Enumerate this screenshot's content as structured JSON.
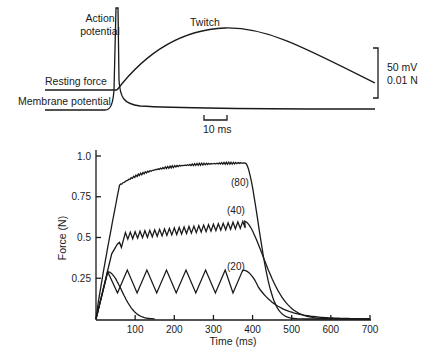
{
  "chart_data": [
    {
      "type": "line",
      "title": "",
      "labels": {
        "action_potential": [
          "Action",
          "potential"
        ],
        "twitch": "Twitch",
        "resting_force": "Resting force",
        "membrane_potential": "Membrane potential"
      },
      "scale_bars": {
        "time": "10 ms",
        "vertical": [
          "50 mV",
          "0.01 N"
        ]
      },
      "series": [
        {
          "name": "Action potential / Membrane potential",
          "description": "sharp spike then decays to resting baseline"
        },
        {
          "name": "Twitch",
          "description": "force rises from resting force, peaks, then slowly declines"
        }
      ]
    },
    {
      "type": "line",
      "title": "",
      "xlabel": "Time (ms)",
      "ylabel": "Force (N)",
      "xlim": [
        0,
        700
      ],
      "ylim": [
        0,
        1.0
      ],
      "xticks": [
        "100",
        "200",
        "300",
        "400",
        "500",
        "600",
        "700"
      ],
      "yticks": [
        "0.25",
        "0.5",
        "0.75",
        "1.0"
      ],
      "series": [
        {
          "name": "single twitch",
          "x": [
            0,
            30,
            60,
            90,
            120,
            150
          ],
          "y": [
            0,
            0.29,
            0.2,
            0.08,
            0.02,
            0.0
          ]
        },
        {
          "name": "(20)",
          "label": "(20)",
          "peaks_ms": [
            30,
            80,
            130,
            180,
            230,
            280,
            330,
            375
          ],
          "peak_force": 0.3,
          "trough_force": 0.16,
          "decay_end_ms": 700
        },
        {
          "name": "(40)",
          "label": "(40)",
          "start_plateau_force": 0.53,
          "end_plateau_force": 0.6,
          "ripple": 0.04,
          "stop_ms": 380,
          "decay_end_ms": 700
        },
        {
          "name": "(80)",
          "label": "(80)",
          "x": [
            0,
            40,
            60,
            80,
            100,
            150,
            200,
            300,
            380,
            400,
            420,
            450,
            500,
            600,
            700
          ],
          "y": [
            0,
            0.6,
            0.82,
            0.87,
            0.9,
            0.93,
            0.94,
            0.955,
            0.96,
            0.75,
            0.4,
            0.15,
            0.05,
            0.015,
            0.0
          ]
        }
      ]
    }
  ]
}
